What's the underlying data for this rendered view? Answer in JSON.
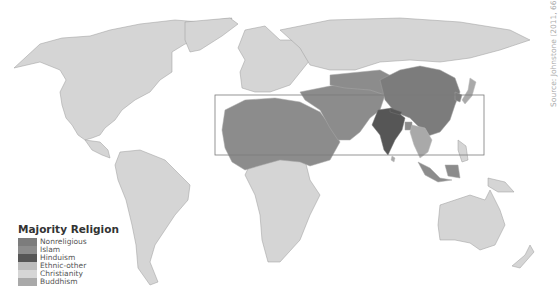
{
  "map": {
    "title": "Majority Religion",
    "source": "Source: Johnstone (2011, 66)",
    "highlight_box": {
      "x": 215,
      "y": 95,
      "width": 269,
      "height": 60
    },
    "colors": {
      "background": "#ffffff",
      "land_christianity": "#d4d4d4",
      "islam": "#8a8a8a",
      "nonreligious": "#7a7a7a",
      "hinduism": "#555555",
      "ethnic_other": "#bdbdbd",
      "buddhism": "#a8a8a8",
      "border": "#999999"
    }
  },
  "legend": {
    "title": "Majority Religion",
    "items": [
      {
        "label": "Nonreligious",
        "color": "#7c7c7c"
      },
      {
        "label": "Islam",
        "color": "#8c8c8c"
      },
      {
        "label": "Hinduism",
        "color": "#565656"
      },
      {
        "label": "Ethnic-other",
        "color": "#bdbdbd"
      },
      {
        "label": "Christianity",
        "color": "#d6d6d6"
      },
      {
        "label": "Buddhism",
        "color": "#a9a9a9"
      }
    ]
  }
}
